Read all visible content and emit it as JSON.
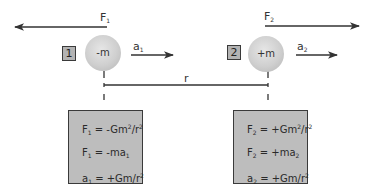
{
  "diagram": {
    "colors": {
      "line": "#333333",
      "box_fill": "#bdbdbd",
      "box_border": "#3a3a3a",
      "ball": "#cfcfcf"
    },
    "separation_label": "r",
    "bodies": [
      {
        "index_label": "1",
        "mass_label": "-m",
        "force": {
          "symbol": "F",
          "sub": "1",
          "direction": "left"
        },
        "acceleration": {
          "symbol": "a",
          "sub": "1",
          "direction": "right"
        },
        "equations": [
          {
            "lhs": "F",
            "lhs_sub": "1",
            "rhs": " = -Gm",
            "sup": "2",
            "tail": "/r",
            "tail_sup": "2"
          },
          {
            "lhs": "F",
            "lhs_sub": "1",
            "rhs": " = -ma",
            "rhs_sub": "1"
          },
          {
            "lhs": "a",
            "lhs_sub": "1",
            "rhs": " = +Gm/r",
            "sup": "2"
          }
        ]
      },
      {
        "index_label": "2",
        "mass_label": "+m",
        "force": {
          "symbol": "F",
          "sub": "2",
          "direction": "right"
        },
        "acceleration": {
          "symbol": "a",
          "sub": "2",
          "direction": "right"
        },
        "equations": [
          {
            "lhs": "F",
            "lhs_sub": "2",
            "rhs": " = +Gm",
            "sup": "2",
            "tail": "/r",
            "tail_sup": "2"
          },
          {
            "lhs": "F",
            "lhs_sub": "2",
            "rhs": " = +ma",
            "rhs_sub": "2"
          },
          {
            "lhs": "a",
            "lhs_sub": "2",
            "rhs": " = +Gm/r",
            "sup": "2"
          }
        ]
      }
    ]
  }
}
